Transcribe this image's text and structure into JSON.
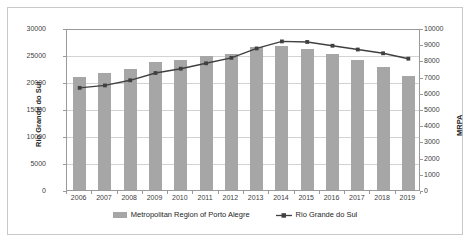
{
  "chart_data": {
    "type": "bar",
    "title": "",
    "xlabel": "",
    "ylabel": "Rio Grande do Sul",
    "y2label": "MRPA",
    "categories": [
      "2006",
      "2007",
      "2008",
      "2009",
      "2010",
      "2011",
      "2012",
      "2013",
      "2014",
      "2015",
      "2016",
      "2017",
      "2018",
      "2019"
    ],
    "ylim": [
      0,
      30000
    ],
    "y2lim": [
      0,
      10000
    ],
    "yticks": [
      "30000",
      "25000",
      "20000",
      "15000",
      "10000",
      "5000",
      "0"
    ],
    "y2ticks": [
      "10000",
      "9000",
      "8000",
      "7000",
      "6000",
      "5000",
      "4000",
      "3000",
      "2000",
      "1000",
      "0"
    ],
    "grid": true,
    "legend_position": "bottom",
    "series": [
      {
        "name": "Metropolitan Region of Porto Alegre",
        "type": "bar",
        "axis": "right",
        "color": "#a6a6a6",
        "values": [
          7000,
          7200,
          7450,
          7900,
          8050,
          8300,
          8400,
          8800,
          8900,
          8700,
          8400,
          8000,
          7600,
          7050
        ]
      },
      {
        "name": "Rio Grande do Sul",
        "type": "line",
        "axis": "left",
        "color": "#404040",
        "values": [
          19100,
          19550,
          20500,
          21850,
          22650,
          23650,
          24650,
          26400,
          27700,
          27600,
          26900,
          26200,
          25500,
          24500
        ]
      }
    ]
  },
  "legend": {
    "items": [
      {
        "label": "Metropolitan Region of Porto Alegre",
        "marker": "bar-swatch"
      },
      {
        "label": "Rio Grande do Sul",
        "marker": "line-marker-swatch"
      }
    ]
  }
}
